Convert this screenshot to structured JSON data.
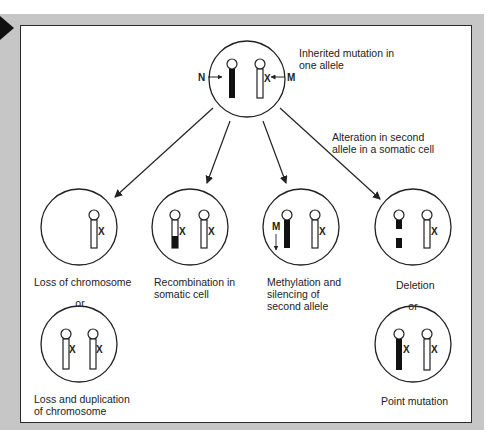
{
  "top_cell": {
    "caption": "Inherited mutation in\none allele",
    "normal_label": "N",
    "mutant_label": "M",
    "mutation_mark": "X"
  },
  "transition_caption": "Alteration in second\nallele in a somatic cell",
  "outcomes": [
    {
      "id": "loss",
      "caption": "Loss of chromosome",
      "mark": "X"
    },
    {
      "id": "recombination",
      "caption": "Recombination in\nsomatic cell",
      "mark": "X"
    },
    {
      "id": "methylation",
      "caption": "Methylation and\nsilencing of\nsecond allele",
      "methyl_label": "M",
      "mark": "X"
    },
    {
      "id": "deletion",
      "caption": "Deletion",
      "mark": "X"
    }
  ],
  "alternatives": [
    {
      "id": "loss-duplication",
      "connector": "or",
      "caption": "Loss and duplication\nof chromosome",
      "mark": "X"
    },
    {
      "id": "point-mutation",
      "connector": "or",
      "caption": "Point mutation",
      "mark": "X"
    }
  ],
  "colors": {
    "frame": "#c6c6c6",
    "panel": "#ffffff",
    "ink": "#222222",
    "chromosome_normal": "#111111",
    "chromosome_mutant": "#ffffff"
  }
}
